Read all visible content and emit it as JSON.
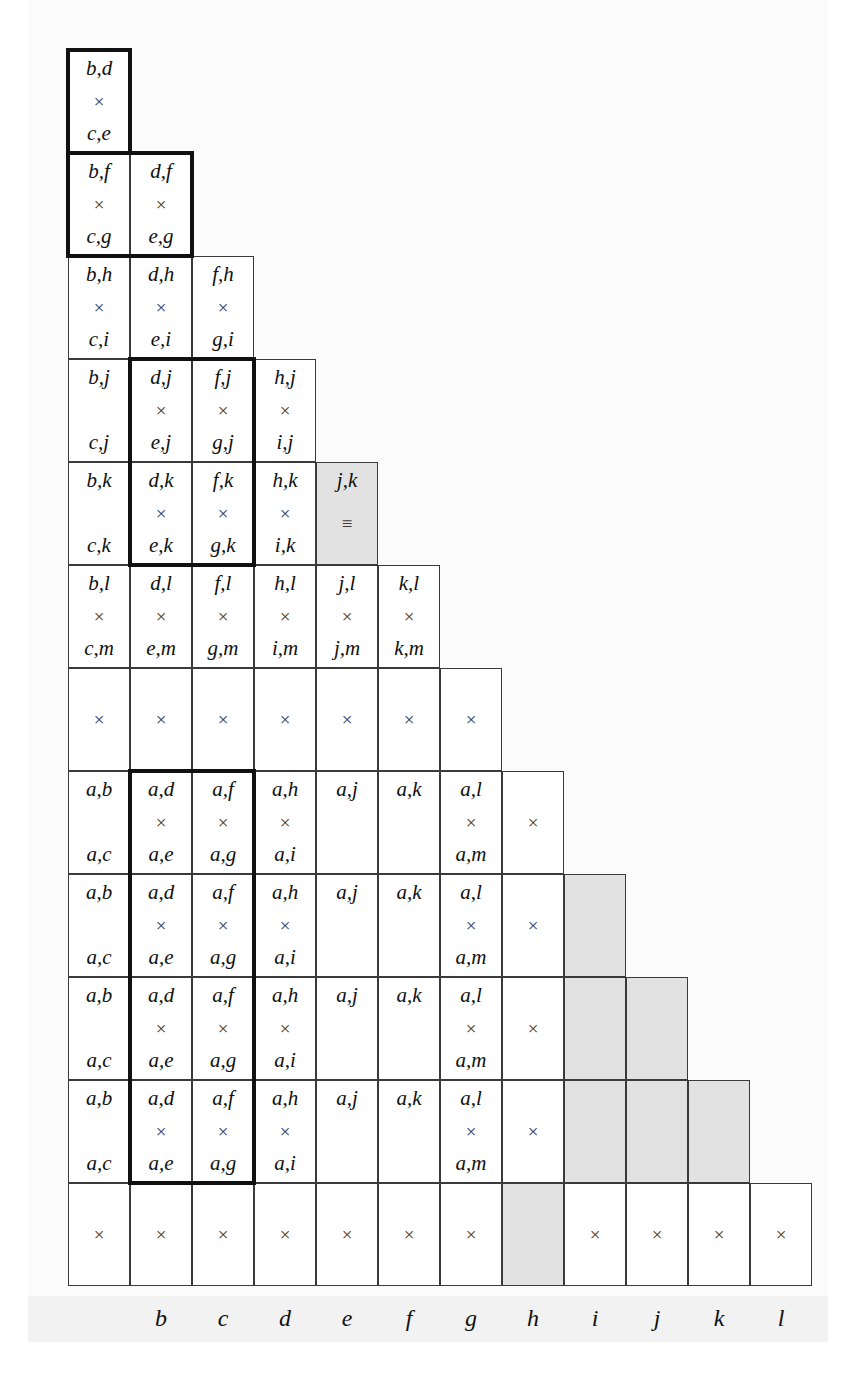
{
  "figure": {
    "type": "lower-triangular-pair-matrix",
    "columns": 12,
    "rows": 13,
    "cell_width": 62,
    "row_height": 103,
    "colors": {
      "shaded": "#e2e2e2",
      "grid_line": "#3a3a3a",
      "heavy_border": "#111111",
      "axis_band": "#f2f2f2",
      "text": "#111111"
    },
    "marks": {
      "times": "×",
      "equiv": "≡"
    }
  },
  "axis": {
    "name": "column-axis",
    "labels": [
      "b",
      "c",
      "d",
      "e",
      "f",
      "g",
      "h",
      "i",
      "j",
      "k",
      "l"
    ]
  },
  "rows": [
    {
      "index": 0,
      "cells": [
        {
          "top": "b,d",
          "mid": "×",
          "bot": "c,e",
          "shaded": false
        }
      ]
    },
    {
      "index": 1,
      "cells": [
        {
          "top": "b,f",
          "mid": "×",
          "bot": "c,g",
          "shaded": false
        },
        {
          "top": "d,f",
          "mid": "×",
          "bot": "e,g",
          "shaded": false
        }
      ]
    },
    {
      "index": 2,
      "cells": [
        {
          "top": "b,h",
          "mid": "×",
          "bot": "c,i",
          "shaded": false
        },
        {
          "top": "d,h",
          "mid": "×",
          "bot": "e,i",
          "shaded": false
        },
        {
          "top": "f,h",
          "mid": "×",
          "bot": "g,i",
          "shaded": false
        }
      ]
    },
    {
      "index": 3,
      "cells": [
        {
          "top": "b,j",
          "mid": "",
          "bot": "c,j",
          "shaded": false
        },
        {
          "top": "d,j",
          "mid": "×",
          "bot": "e,j",
          "shaded": false
        },
        {
          "top": "f,j",
          "mid": "×",
          "bot": "g,j",
          "shaded": false
        },
        {
          "top": "h,j",
          "mid": "×",
          "bot": "i,j",
          "shaded": false
        }
      ]
    },
    {
      "index": 4,
      "cells": [
        {
          "top": "b,k",
          "mid": "",
          "bot": "c,k",
          "shaded": false
        },
        {
          "top": "d,k",
          "mid": "×",
          "bot": "e,k",
          "shaded": false
        },
        {
          "top": "f,k",
          "mid": "×",
          "bot": "g,k",
          "shaded": false
        },
        {
          "top": "h,k",
          "mid": "×",
          "bot": "i,k",
          "shaded": false
        },
        {
          "top": "j,k",
          "mid": "≡",
          "bot": "",
          "shaded": true
        }
      ]
    },
    {
      "index": 5,
      "cells": [
        {
          "top": "b,l",
          "mid": "×",
          "bot": "c,m",
          "shaded": false
        },
        {
          "top": "d,l",
          "mid": "×",
          "bot": "e,m",
          "shaded": false
        },
        {
          "top": "f,l",
          "mid": "×",
          "bot": "g,m",
          "shaded": false
        },
        {
          "top": "h,l",
          "mid": "×",
          "bot": "i,m",
          "shaded": false
        },
        {
          "top": "j,l",
          "mid": "×",
          "bot": "j,m",
          "shaded": false
        },
        {
          "top": "k,l",
          "mid": "×",
          "bot": "k,m",
          "shaded": false
        }
      ]
    },
    {
      "index": 6,
      "single": true,
      "cells": [
        {
          "top": "",
          "mid": "×",
          "bot": "",
          "shaded": false
        },
        {
          "top": "",
          "mid": "×",
          "bot": "",
          "shaded": false
        },
        {
          "top": "",
          "mid": "×",
          "bot": "",
          "shaded": false
        },
        {
          "top": "",
          "mid": "×",
          "bot": "",
          "shaded": false
        },
        {
          "top": "",
          "mid": "×",
          "bot": "",
          "shaded": false
        },
        {
          "top": "",
          "mid": "×",
          "bot": "",
          "shaded": false
        },
        {
          "top": "",
          "mid": "×",
          "bot": "",
          "shaded": false
        }
      ]
    },
    {
      "index": 7,
      "cells": [
        {
          "top": "a,b",
          "mid": "",
          "bot": "a,c",
          "shaded": false
        },
        {
          "top": "a,d",
          "mid": "×",
          "bot": "a,e",
          "shaded": false
        },
        {
          "top": "a,f",
          "mid": "×",
          "bot": "a,g",
          "shaded": false
        },
        {
          "top": "a,h",
          "mid": "×",
          "bot": "a,i",
          "shaded": false
        },
        {
          "top": "a,j",
          "mid": "",
          "bot": "",
          "shaded": false
        },
        {
          "top": "a,k",
          "mid": "",
          "bot": "",
          "shaded": false
        },
        {
          "top": "a,l",
          "mid": "×",
          "bot": "a,m",
          "shaded": false
        },
        {
          "top": "",
          "mid": "×",
          "bot": "",
          "shaded": false
        }
      ]
    },
    {
      "index": 8,
      "cells": [
        {
          "top": "a,b",
          "mid": "",
          "bot": "a,c",
          "shaded": false
        },
        {
          "top": "a,d",
          "mid": "×",
          "bot": "a,e",
          "shaded": false
        },
        {
          "top": "a,f",
          "mid": "×",
          "bot": "a,g",
          "shaded": false
        },
        {
          "top": "a,h",
          "mid": "×",
          "bot": "a,i",
          "shaded": false
        },
        {
          "top": "a,j",
          "mid": "",
          "bot": "",
          "shaded": false
        },
        {
          "top": "a,k",
          "mid": "",
          "bot": "",
          "shaded": false
        },
        {
          "top": "a,l",
          "mid": "×",
          "bot": "a,m",
          "shaded": false
        },
        {
          "top": "",
          "mid": "×",
          "bot": "",
          "shaded": false
        },
        {
          "top": "",
          "mid": "",
          "bot": "",
          "shaded": true
        }
      ]
    },
    {
      "index": 9,
      "cells": [
        {
          "top": "a,b",
          "mid": "",
          "bot": "a,c",
          "shaded": false
        },
        {
          "top": "a,d",
          "mid": "×",
          "bot": "a,e",
          "shaded": false
        },
        {
          "top": "a,f",
          "mid": "×",
          "bot": "a,g",
          "shaded": false
        },
        {
          "top": "a,h",
          "mid": "×",
          "bot": "a,i",
          "shaded": false
        },
        {
          "top": "a,j",
          "mid": "",
          "bot": "",
          "shaded": false
        },
        {
          "top": "a,k",
          "mid": "",
          "bot": "",
          "shaded": false
        },
        {
          "top": "a,l",
          "mid": "×",
          "bot": "a,m",
          "shaded": false
        },
        {
          "top": "",
          "mid": "×",
          "bot": "",
          "shaded": false
        },
        {
          "top": "",
          "mid": "",
          "bot": "",
          "shaded": true
        },
        {
          "top": "",
          "mid": "",
          "bot": "",
          "shaded": true
        }
      ]
    },
    {
      "index": 10,
      "cells": [
        {
          "top": "a,b",
          "mid": "",
          "bot": "a,c",
          "shaded": false
        },
        {
          "top": "a,d",
          "mid": "×",
          "bot": "a,e",
          "shaded": false
        },
        {
          "top": "a,f",
          "mid": "×",
          "bot": "a,g",
          "shaded": false
        },
        {
          "top": "a,h",
          "mid": "×",
          "bot": "a,i",
          "shaded": false
        },
        {
          "top": "a,j",
          "mid": "",
          "bot": "",
          "shaded": false
        },
        {
          "top": "a,k",
          "mid": "",
          "bot": "",
          "shaded": false
        },
        {
          "top": "a,l",
          "mid": "×",
          "bot": "a,m",
          "shaded": false
        },
        {
          "top": "",
          "mid": "×",
          "bot": "",
          "shaded": false
        },
        {
          "top": "",
          "mid": "",
          "bot": "",
          "shaded": true
        },
        {
          "top": "",
          "mid": "",
          "bot": "",
          "shaded": true
        },
        {
          "top": "",
          "mid": "",
          "bot": "",
          "shaded": true
        }
      ]
    },
    {
      "index": 11,
      "single": true,
      "cells": [
        {
          "top": "",
          "mid": "×",
          "bot": "",
          "shaded": false
        },
        {
          "top": "",
          "mid": "×",
          "bot": "",
          "shaded": false
        },
        {
          "top": "",
          "mid": "×",
          "bot": "",
          "shaded": false
        },
        {
          "top": "",
          "mid": "×",
          "bot": "",
          "shaded": false
        },
        {
          "top": "",
          "mid": "×",
          "bot": "",
          "shaded": false
        },
        {
          "top": "",
          "mid": "×",
          "bot": "",
          "shaded": false
        },
        {
          "top": "",
          "mid": "×",
          "bot": "",
          "shaded": false
        },
        {
          "top": "",
          "mid": "",
          "bot": "",
          "shaded": true
        },
        {
          "top": "",
          "mid": "×",
          "bot": "",
          "shaded": false
        },
        {
          "top": "",
          "mid": "×",
          "bot": "",
          "shaded": false
        },
        {
          "top": "",
          "mid": "×",
          "bot": "",
          "shaded": false
        },
        {
          "top": "",
          "mid": "×",
          "bot": "",
          "shaded": false
        }
      ]
    }
  ],
  "heavy_outlines": [
    {
      "name": "outline-bd-ce",
      "col": 0,
      "row": 0,
      "cols": 1,
      "rows": 1
    },
    {
      "name": "outline-bf-cg-dfeg",
      "col": 0,
      "row": 1,
      "cols": 2,
      "rows": 1
    },
    {
      "name": "outline-dj-fk",
      "col": 1,
      "row": 3,
      "cols": 2,
      "rows": 2
    },
    {
      "name": "outline-ad-af-block",
      "col": 1,
      "row": 7,
      "cols": 2,
      "rows": 4
    }
  ]
}
